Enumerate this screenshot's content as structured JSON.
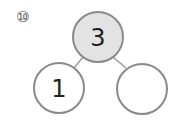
{
  "problem": {
    "number_label": "⑩"
  },
  "number_bond": {
    "whole": "3",
    "parts": [
      "1",
      ""
    ],
    "colors": {
      "whole_fill": "#e3e3e3",
      "part_fill": "#ffffff",
      "stroke": "#8a8a8a",
      "text": "#222222"
    }
  }
}
